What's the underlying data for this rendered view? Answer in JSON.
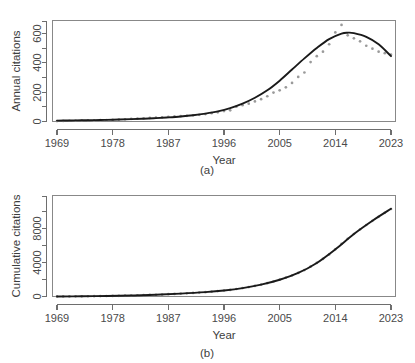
{
  "figure": {
    "panels": [
      {
        "caption": "(a)",
        "xlabel": "Year",
        "ylabel": "Annual citations"
      },
      {
        "caption": "(b)",
        "xlabel": "Year",
        "ylabel": "Cumulative citations"
      }
    ]
  },
  "colors": {
    "point": "#9a9a9a",
    "curve": "#1a1a1a",
    "axis": "#6e6e6e",
    "box": "#888888",
    "background": "#ffffff"
  },
  "chart_data": [
    {
      "type": "scatter",
      "title": "",
      "caption": "(a)",
      "xlabel": "Year",
      "ylabel": "Annual citations",
      "xlim": [
        1969,
        2023
      ],
      "ylim": [
        0,
        680
      ],
      "xticks": [
        1969,
        1978,
        1987,
        1996,
        2005,
        2014,
        2023
      ],
      "xtick_labels": [
        "1969",
        "1978",
        "1987",
        "1996",
        "2005",
        "2014",
        "2023"
      ],
      "yticks": [
        0,
        200,
        400,
        600
      ],
      "ytick_labels": [
        "0",
        "200",
        "400",
        "600"
      ],
      "yticks_minor": [
        100,
        300,
        500
      ],
      "grid": false,
      "legend": null,
      "series": [
        {
          "name": "Annual citations",
          "kind": "points",
          "marker": "dot",
          "color": "#9a9a9a",
          "x": [
            1969,
            1970,
            1971,
            1972,
            1973,
            1974,
            1975,
            1976,
            1977,
            1978,
            1979,
            1980,
            1981,
            1982,
            1983,
            1984,
            1985,
            1986,
            1987,
            1988,
            1989,
            1990,
            1991,
            1992,
            1993,
            1994,
            1995,
            1996,
            1997,
            1998,
            1999,
            2000,
            2001,
            2002,
            2003,
            2004,
            2005,
            2006,
            2007,
            2008,
            2009,
            2010,
            2011,
            2012,
            2013,
            2014,
            2015,
            2016,
            2017,
            2018,
            2019,
            2020,
            2021,
            2022,
            2023
          ],
          "y": [
            3,
            4,
            5,
            6,
            6,
            7,
            8,
            9,
            10,
            11,
            13,
            15,
            18,
            20,
            22,
            24,
            26,
            28,
            31,
            34,
            36,
            38,
            42,
            45,
            50,
            56,
            62,
            70,
            75,
            100,
            110,
            120,
            135,
            150,
            170,
            195,
            210,
            230,
            260,
            300,
            330,
            400,
            440,
            470,
            520,
            600,
            650,
            580,
            560,
            540,
            510,
            490,
            470,
            460,
            450
          ]
        },
        {
          "name": "Fitted trend",
          "kind": "line",
          "color": "#1a1a1a",
          "x": [
            1969,
            1971,
            1973,
            1975,
            1977,
            1979,
            1981,
            1983,
            1985,
            1987,
            1989,
            1991,
            1993,
            1995,
            1997,
            1999,
            2001,
            2003,
            2005,
            2007,
            2009,
            2011,
            2013,
            2015,
            2016,
            2017,
            2019,
            2021,
            2023
          ],
          "y": [
            6,
            7,
            8,
            9,
            11,
            13,
            16,
            19,
            23,
            28,
            34,
            42,
            53,
            68,
            90,
            120,
            160,
            210,
            275,
            350,
            425,
            495,
            555,
            592,
            598,
            595,
            570,
            520,
            440
          ]
        }
      ]
    },
    {
      "type": "scatter",
      "title": "",
      "caption": "(b)",
      "xlabel": "Year",
      "ylabel": "Cumulative citations",
      "xlim": [
        1969,
        2023
      ],
      "ylim": [
        0,
        11800
      ],
      "xticks": [
        1969,
        1978,
        1987,
        1996,
        2005,
        2014,
        2023
      ],
      "xtick_labels": [
        "1969",
        "1978",
        "1987",
        "1996",
        "2005",
        "2014",
        "2023"
      ],
      "yticks": [
        0,
        4000,
        8000
      ],
      "ytick_labels": [
        "0",
        "4000",
        "8000"
      ],
      "yticks_minor": [
        2000,
        6000,
        10000
      ],
      "grid": false,
      "legend": null,
      "series": [
        {
          "name": "Cumulative citations",
          "kind": "points",
          "marker": "dot",
          "color": "#9a9a9a",
          "x": [
            1969,
            1970,
            1971,
            1972,
            1973,
            1974,
            1975,
            1976,
            1977,
            1978,
            1979,
            1980,
            1981,
            1982,
            1983,
            1984,
            1985,
            1986,
            1987,
            1988,
            1989,
            1990,
            1991,
            1992,
            1993,
            1994,
            1995,
            1996,
            1997,
            1998,
            1999,
            2000,
            2001,
            2002,
            2003,
            2004,
            2005,
            2006,
            2007,
            2008,
            2009,
            2010,
            2011,
            2012,
            2013,
            2014,
            2015,
            2016,
            2017,
            2018,
            2019,
            2020,
            2021,
            2022,
            2023
          ],
          "y": [
            3,
            7,
            12,
            18,
            24,
            31,
            39,
            48,
            58,
            69,
            82,
            97,
            115,
            135,
            157,
            181,
            207,
            235,
            266,
            300,
            336,
            374,
            416,
            461,
            511,
            567,
            629,
            699,
            774,
            874,
            984,
            1104,
            1239,
            1389,
            1559,
            1754,
            1964,
            2194,
            2454,
            2754,
            3084,
            3484,
            3924,
            4394,
            4914,
            5514,
            6164,
            6744,
            7304,
            7844,
            8354,
            8844,
            9314,
            9774,
            10224
          ]
        },
        {
          "name": "Fitted trend",
          "kind": "line",
          "color": "#1a1a1a",
          "x": [
            1969,
            1973,
            1977,
            1981,
            1985,
            1989,
            1993,
            1996,
            1999,
            2002,
            2005,
            2008,
            2011,
            2014,
            2017,
            2020,
            2023
          ],
          "y": [
            5,
            25,
            60,
            115,
            205,
            335,
            510,
            700,
            980,
            1390,
            1960,
            2750,
            3920,
            5510,
            7300,
            8850,
            10250
          ]
        }
      ]
    }
  ]
}
